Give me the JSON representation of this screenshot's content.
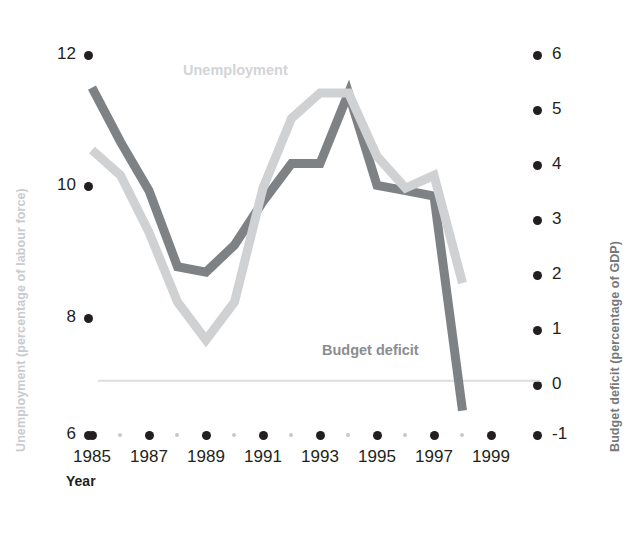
{
  "chart_data": {
    "type": "line",
    "title": "",
    "subtitle": "",
    "xlabel": "Year",
    "grid": false,
    "legend_position": "inline-direct-labels",
    "x": [
      1985,
      1986,
      1987,
      1988,
      1989,
      1990,
      1991,
      1992,
      1993,
      1994,
      1995,
      1996,
      1997,
      1998
    ],
    "xlim": [
      1985,
      1999.5
    ],
    "xticks": [
      1985,
      1987,
      1989,
      1991,
      1993,
      1995,
      1997,
      1999
    ],
    "xtick_labels": [
      "1985",
      "1987",
      "1989",
      "1991",
      "1993",
      "1995",
      "1997",
      "1999"
    ],
    "xminor_ticks": [
      1986,
      1988,
      1990,
      1992,
      1994,
      1996,
      1998
    ],
    "axes": [
      {
        "id": "left",
        "label": "Unemployment (percentage of labour force)",
        "ylim": [
          6,
          12
        ],
        "yticks": [
          6,
          8,
          10,
          12
        ],
        "ytick_labels": [
          "6",
          "8",
          "10",
          "12"
        ],
        "color": "#c9cbcd"
      },
      {
        "id": "right",
        "label": "Budget deficit (percentage of GDP)",
        "ylim": [
          -1,
          6
        ],
        "yticks": [
          -1,
          0,
          1,
          2,
          3,
          4,
          5,
          6
        ],
        "ytick_labels": [
          "-1",
          "0",
          "1",
          "2",
          "3",
          "4",
          "5",
          "6"
        ],
        "color": "#76797c"
      }
    ],
    "series": [
      {
        "name": "Unemployment",
        "axis": "left",
        "color": "#cfd1d3",
        "label_text": "Unemployment",
        "values": [
          10.5,
          10.1,
          9.2,
          8.1,
          7.5,
          8.1,
          9.9,
          11.0,
          11.4,
          11.4,
          10.4,
          9.9,
          10.1,
          8.4
        ]
      },
      {
        "name": "Budget deficit",
        "axis": "right",
        "color": "#7f8285",
        "label_text": "Budget deficit",
        "values": [
          5.4,
          4.4,
          3.5,
          2.1,
          2.0,
          2.5,
          3.3,
          4.0,
          4.0,
          5.3,
          3.6,
          3.5,
          3.4,
          -0.55
        ]
      }
    ],
    "zero_line": {
      "axis": "right",
      "value": 0,
      "color": "#dcdddf"
    }
  },
  "labels": {
    "left_axis_title": "Unemployment (percentage of labour force)",
    "right_axis_title": "Budget deficit (percentage of GDP)",
    "x_axis_title": "Year",
    "series_unemployment": "Unemployment",
    "series_budget": "Budget deficit"
  },
  "left_ticks": [
    {
      "value": "12",
      "y": 55
    },
    {
      "value": "10",
      "y": 186
    },
    {
      "value": "8",
      "y": 318
    },
    {
      "value": "6",
      "y": 435
    }
  ],
  "right_ticks": [
    {
      "value": "6",
      "y": 55
    },
    {
      "value": "5",
      "y": 110
    },
    {
      "value": "4",
      "y": 165
    },
    {
      "value": "3",
      "y": 220
    },
    {
      "value": "2",
      "y": 275
    },
    {
      "value": "1",
      "y": 330
    },
    {
      "value": "0",
      "y": 385
    },
    {
      "value": "-1",
      "y": 435
    }
  ],
  "x_ticks": [
    {
      "label": "1985",
      "x": 92
    },
    {
      "label": "1987",
      "x": 149
    },
    {
      "label": "1989",
      "x": 206
    },
    {
      "label": "1991",
      "x": 263
    },
    {
      "label": "1993",
      "x": 320
    },
    {
      "label": "1995",
      "x": 377
    },
    {
      "label": "1997",
      "x": 434
    },
    {
      "label": "1999",
      "x": 491
    }
  ],
  "x_minor_ticks": [
    {
      "x": 120
    },
    {
      "x": 177
    },
    {
      "x": 234
    },
    {
      "x": 291
    },
    {
      "x": 348
    },
    {
      "x": 405
    },
    {
      "x": 462
    }
  ],
  "colors": {
    "unemployment_line": "#cfd1d3",
    "budget_line": "#7f8285",
    "tick_dot": "#231f20",
    "minor_dot": "#c6c8ca",
    "zero_line": "#dcdddf",
    "left_title": "#c9cbcd",
    "right_title": "#76797c",
    "background": "#ffffff"
  }
}
